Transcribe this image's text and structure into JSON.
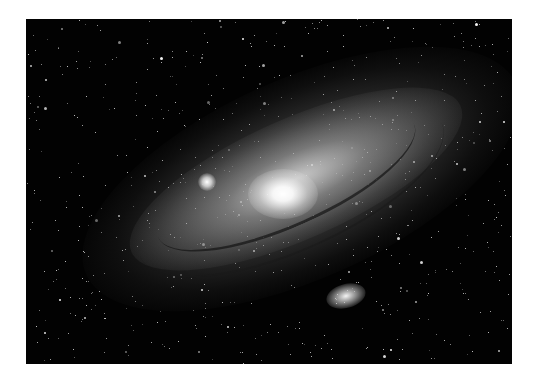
{
  "image": {
    "subject": "Andromeda galaxy (spiral galaxy) with satellite galaxies against a starfield",
    "style": "grayscale astrophotograph",
    "background_color": "#ffffff",
    "sky_color": "#020202"
  }
}
